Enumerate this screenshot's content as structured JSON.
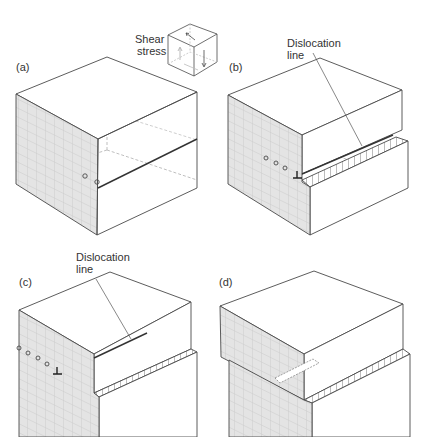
{
  "figure": {
    "panels": [
      {
        "id": "a",
        "label": "(a)"
      },
      {
        "id": "b",
        "label": "(b)",
        "annotation_line1": "Dislocation",
        "annotation_line2": "line"
      },
      {
        "id": "c",
        "label": "(c)",
        "annotation_line1": "Dislocation",
        "annotation_line2": "line"
      },
      {
        "id": "d",
        "label": "(d)"
      }
    ],
    "inset": {
      "line1": "Shear",
      "line2": "stress"
    },
    "colors": {
      "edge": "#4a4a4a",
      "hidden_edge": "#b8b8b8",
      "grid_face": "#e4e4e4",
      "grid_line": "#c4c4c4",
      "text": "#333333"
    }
  }
}
